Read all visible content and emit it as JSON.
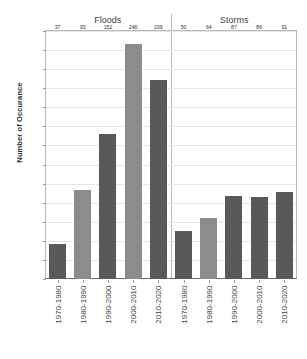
{
  "chart_data": {
    "type": "bar",
    "title": "",
    "xlabel": "",
    "ylabel": "Number of Occurance",
    "ylim": [
      0,
      260
    ],
    "ytick_step": 20,
    "yticks": [
      0,
      20,
      40,
      60,
      80,
      100,
      120,
      140,
      160,
      180,
      200,
      220,
      240,
      260
    ],
    "grid": true,
    "legend": "none",
    "categories": [
      "1970-1980",
      "1980-1990",
      "1990-2000",
      "2000-2010",
      "2010-2020"
    ],
    "panels": [
      {
        "name": "Floods",
        "values": [
          37,
          93,
          152,
          246,
          209
        ],
        "bar_colors": [
          "#595959",
          "#8c8c8c",
          "#595959",
          "#8c8c8c",
          "#595959"
        ]
      },
      {
        "name": "Storms",
        "values": [
          50,
          64,
          87,
          86,
          91
        ],
        "bar_colors": [
          "#595959",
          "#8c8c8c",
          "#595959",
          "#595959",
          "#595959"
        ]
      }
    ],
    "series": [
      {
        "name": "Floods",
        "values": [
          37,
          93,
          152,
          246,
          209
        ]
      },
      {
        "name": "Storms",
        "values": [
          50,
          64,
          87,
          86,
          91
        ]
      }
    ],
    "colors": {
      "bar_dark": "#595959",
      "bar_light": "#8c8c8c",
      "grid": "#e6e6e6",
      "frame": "#b9b9b9",
      "axis": "#6b6b6b",
      "text": "#3f3f3f"
    }
  }
}
